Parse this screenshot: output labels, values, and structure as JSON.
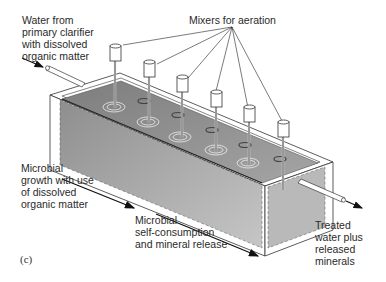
{
  "figure": {
    "panel_letter": "(c)",
    "labels": {
      "inflow": "Water from\nprimary clarifier\nwith dissolved\norganic matter",
      "mixers": "Mixers for aeration",
      "growth": "Microbial\ngrowth with use\nof dissolved\norganic matter",
      "self_consumption": "Microbial\nself-consumption\nand mineral release",
      "outflow": "Treated\nwater plus\nreleased\nminerals"
    },
    "mixer_count": 6,
    "colors": {
      "water": "#8a8a8a",
      "water_side": "#a9a9a9",
      "tank_wall": "#ffffff",
      "outline": "#333333"
    }
  }
}
